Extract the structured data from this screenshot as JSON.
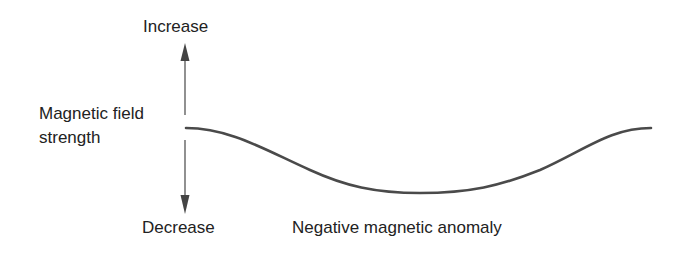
{
  "diagram": {
    "axis": {
      "label_line1": "Magnetic field",
      "label_line2": "strength",
      "top_label": "Increase",
      "bottom_label": "Decrease"
    },
    "curve": {
      "caption": "Negative magnetic anomaly",
      "description": "Flat baseline that dips smoothly to a broad minimum and rises back to baseline"
    },
    "colors": {
      "line": "#4a4a4a",
      "text": "#222222",
      "background": "#ffffff"
    }
  }
}
